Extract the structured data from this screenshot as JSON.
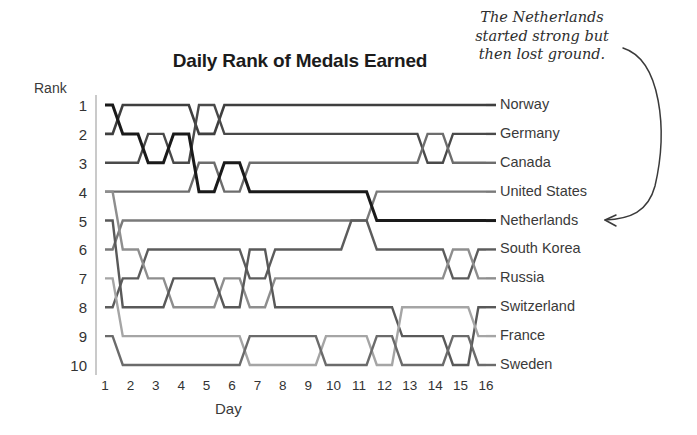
{
  "chart_data": {
    "type": "line",
    "subtype": "bump-chart",
    "title": "Daily Rank of Medals Earned",
    "xlabel": "Day",
    "ylabel": "Rank",
    "x": [
      1,
      2,
      3,
      4,
      5,
      6,
      7,
      8,
      9,
      10,
      11,
      12,
      13,
      14,
      15,
      16
    ],
    "xticklabels": [
      "1",
      "2",
      "3",
      "4",
      "5",
      "6",
      "7",
      "8",
      "9",
      "10",
      "11",
      "12",
      "13",
      "14",
      "15",
      "16"
    ],
    "yticklabels": [
      "1",
      "2",
      "3",
      "4",
      "5",
      "6",
      "7",
      "8",
      "9",
      "10"
    ],
    "ylim": [
      1,
      10
    ],
    "y_inverted": true,
    "grid": false,
    "legend": "right-of-plot-series-labels",
    "annotations": [
      {
        "text": "The Netherlands started strong but then lost ground.",
        "lines": [
          "The Netherlands",
          "started strong but",
          "then lost ground."
        ],
        "points_to": "Netherlands",
        "style": "handwritten-italic-with-curved-arrow"
      }
    ],
    "series": [
      {
        "name": "Norway",
        "color": "#3f3f3f",
        "width": 2.6,
        "values": [
          2,
          1,
          1,
          1,
          2,
          1,
          1,
          1,
          1,
          1,
          1,
          1,
          1,
          1,
          1,
          1
        ]
      },
      {
        "name": "Germany",
        "color": "#4a4a4a",
        "width": 2.4,
        "values": [
          3,
          3,
          2,
          3,
          1,
          2,
          2,
          2,
          2,
          2,
          2,
          2,
          2,
          3,
          2,
          2
        ]
      },
      {
        "name": "Canada",
        "color": "#6d6d6d",
        "width": 2.4,
        "values": [
          4,
          4,
          4,
          4,
          3,
          4,
          3,
          3,
          3,
          3,
          3,
          3,
          3,
          2,
          3,
          3
        ]
      },
      {
        "name": "United States",
        "color": "#7a7a7a",
        "width": 2.4,
        "values": [
          6,
          5,
          5,
          5,
          5,
          5,
          5,
          5,
          5,
          5,
          5,
          4,
          4,
          4,
          4,
          4
        ]
      },
      {
        "name": "Netherlands",
        "color": "#1a1a1a",
        "width": 3.0,
        "values": [
          1,
          2,
          3,
          2,
          4,
          3,
          4,
          4,
          4,
          4,
          4,
          5,
          5,
          5,
          5,
          5
        ]
      },
      {
        "name": "South Korea",
        "color": "#5c5c5c",
        "width": 2.4,
        "values": [
          8,
          7,
          6,
          6,
          6,
          6,
          7,
          6,
          6,
          6,
          5,
          6,
          6,
          6,
          7,
          6
        ]
      },
      {
        "name": "Russia",
        "color": "#8e8e8e",
        "width": 2.4,
        "values": [
          4,
          6,
          7,
          8,
          8,
          7,
          8,
          7,
          7,
          7,
          7,
          7,
          7,
          7,
          6,
          7
        ]
      },
      {
        "name": "Switzerland",
        "color": "#595959",
        "width": 2.4,
        "values": [
          5,
          8,
          8,
          7,
          7,
          8,
          6,
          8,
          8,
          8,
          8,
          8,
          9,
          9,
          10,
          8
        ]
      },
      {
        "name": "France",
        "color": "#a5a5a5",
        "width": 2.4,
        "values": [
          7,
          9,
          9,
          9,
          9,
          9,
          10,
          10,
          10,
          9,
          9,
          10,
          8,
          8,
          8,
          9
        ]
      },
      {
        "name": "Sweden",
        "color": "#6b6b6b",
        "width": 2.4,
        "values": [
          9,
          10,
          10,
          10,
          10,
          10,
          9,
          9,
          9,
          10,
          10,
          9,
          10,
          10,
          9,
          10
        ]
      }
    ]
  },
  "labels": {
    "rank_axis": "Rank",
    "day_axis": "Day"
  },
  "accent_colors": {
    "background": "#ffffff",
    "text": "#333333",
    "axis": "#bdbdbd",
    "highlight_series": "#1a1a1a"
  }
}
